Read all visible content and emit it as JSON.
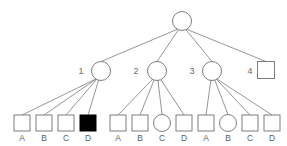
{
  "figure": {
    "type": "pedigree-tree-diagram",
    "width": 287,
    "height": 146,
    "background_color": "#ffffff",
    "line_color": "#8a8a8a",
    "shape_stroke_color": "#7d7d7d",
    "shape_fill_color": "#ffffff",
    "filled_shape_color": "#000000",
    "text_color": "#5d5d5d"
  },
  "root": {
    "id": "root",
    "shape": "circle",
    "filled": false,
    "label": "",
    "cx": 182,
    "cy": 21,
    "r": 9.5
  },
  "level2": [
    {
      "id": "n1",
      "label": "1",
      "shape": "circle",
      "filled": false,
      "cx": 101,
      "cy": 71,
      "r": 9.5,
      "label_x": 81,
      "label_y": 74
    },
    {
      "id": "n2",
      "label": "2",
      "shape": "circle",
      "filled": false,
      "cx": 157,
      "cy": 71,
      "r": 9.5,
      "label_x": 136,
      "label_y": 74
    },
    {
      "id": "n3",
      "label": "3",
      "shape": "circle",
      "filled": false,
      "cx": 212,
      "cy": 71,
      "r": 9.5,
      "label_x": 192,
      "label_y": 74
    },
    {
      "id": "n4",
      "label": "4",
      "shape": "square",
      "filled": false,
      "cx": 266,
      "cy": 70,
      "size": 17,
      "label_x": 250,
      "label_y": 74
    }
  ],
  "level3_groups": [
    {
      "parent": "n1",
      "children": [
        {
          "id": "g1a",
          "label": "A",
          "shape": "square",
          "filled": false,
          "cx": 22,
          "cy": 123,
          "size": 16
        },
        {
          "id": "g1b",
          "label": "B",
          "shape": "square",
          "filled": false,
          "cx": 44,
          "cy": 123,
          "size": 16
        },
        {
          "id": "g1c",
          "label": "C",
          "shape": "square",
          "filled": false,
          "cx": 66,
          "cy": 123,
          "size": 16
        },
        {
          "id": "g1d",
          "label": "D",
          "shape": "square",
          "filled": true,
          "cx": 88,
          "cy": 123,
          "size": 16
        }
      ]
    },
    {
      "parent": "n2",
      "children": [
        {
          "id": "g2a",
          "label": "A",
          "shape": "square",
          "filled": false,
          "cx": 118,
          "cy": 123,
          "size": 16
        },
        {
          "id": "g2b",
          "label": "B",
          "shape": "square",
          "filled": false,
          "cx": 140,
          "cy": 123,
          "size": 16
        },
        {
          "id": "g2c",
          "label": "C",
          "shape": "circle",
          "filled": false,
          "cx": 162,
          "cy": 123,
          "r": 8.5
        },
        {
          "id": "g2d",
          "label": "D",
          "shape": "square",
          "filled": false,
          "cx": 184,
          "cy": 123,
          "size": 16
        }
      ]
    },
    {
      "parent": "n3",
      "children": [
        {
          "id": "g3a",
          "label": "A",
          "shape": "square",
          "filled": false,
          "cx": 206,
          "cy": 123,
          "size": 16
        },
        {
          "id": "g3b",
          "label": "B",
          "shape": "circle",
          "filled": false,
          "cx": 228,
          "cy": 123,
          "r": 8.5
        },
        {
          "id": "g3c",
          "label": "C",
          "shape": "square",
          "filled": false,
          "cx": 250,
          "cy": 123,
          "size": 16
        },
        {
          "id": "g3d",
          "label": "D",
          "shape": "square",
          "filled": false,
          "cx": 272,
          "cy": 123,
          "size": 16
        }
      ]
    }
  ],
  "child_label_y": 141,
  "legend": {
    "filled_meaning": "",
    "open_meaning": ""
  }
}
